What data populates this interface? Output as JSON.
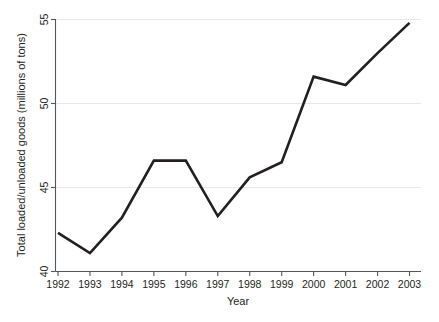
{
  "chart_data": {
    "type": "line",
    "title": "",
    "subtitle": "",
    "xlabel": "Year",
    "ylabel": "Total loaded/unloaded goods (millions of tons)",
    "x": [
      1992,
      1993,
      1994,
      1995,
      1996,
      1997,
      1998,
      1999,
      2000,
      2001,
      2002,
      2003
    ],
    "categories": [
      "1992",
      "1993",
      "1994",
      "1995",
      "1996",
      "1997",
      "1998",
      "1999",
      "2000",
      "2001",
      "2002",
      "2003"
    ],
    "values": [
      42.3,
      41.1,
      43.2,
      46.6,
      46.6,
      43.3,
      45.6,
      46.5,
      51.6,
      51.1,
      53.0,
      54.8
    ],
    "series": [
      {
        "name": "Total loaded/unloaded goods",
        "values": [
          42.3,
          41.1,
          43.2,
          46.6,
          46.6,
          43.3,
          45.6,
          46.5,
          51.6,
          51.1,
          53.0,
          54.8
        ],
        "color": "#231f20"
      }
    ],
    "xlim": [
      1992,
      2003
    ],
    "ylim": [
      40,
      55
    ],
    "yticks": [
      40,
      45,
      50,
      55
    ],
    "yticklabels": [
      "40",
      "45",
      "50",
      "55"
    ],
    "xticks": [
      1992,
      1993,
      1994,
      1995,
      1996,
      1997,
      1998,
      1999,
      2000,
      2001,
      2002,
      2003
    ],
    "xticklabels": [
      "1992",
      "1993",
      "1994",
      "1995",
      "1996",
      "1997",
      "1998",
      "1999",
      "2000",
      "2001",
      "2002",
      "2003"
    ],
    "grid": true,
    "grid_axis": "y",
    "grid_color": "#e9e9e9",
    "legend": false,
    "legend_position": "none",
    "line_width": 2.6,
    "marker": "none",
    "background": "#ffffff",
    "axis_color": "#55555a"
  },
  "axes": {
    "y_title": "Total loaded/unloaded goods (millions of tons)",
    "x_title": "Year",
    "y_tick_labels": [
      "55",
      "50",
      "45",
      "40"
    ],
    "x_tick_labels": [
      "1992",
      "1993",
      "1994",
      "1995",
      "1996",
      "1997",
      "1998",
      "1999",
      "2000",
      "2001",
      "2002",
      "2003"
    ]
  }
}
